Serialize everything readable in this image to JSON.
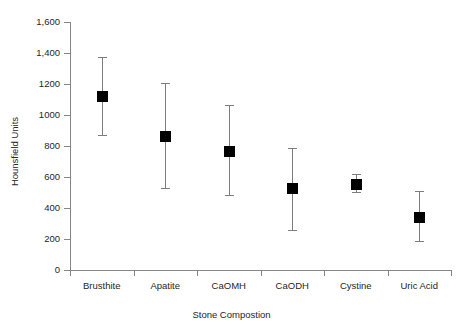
{
  "chart_data": {
    "type": "scatter",
    "title": "",
    "xlabel": "Stone Compostion",
    "ylabel": "Hounsfield Units",
    "categories": [
      "Brusthite",
      "Apatite",
      "CaOMH",
      "CaODH",
      "Cystine",
      "Uric Acid"
    ],
    "values": [
      1125,
      865,
      770,
      528,
      558,
      345
    ],
    "error_low": [
      870,
      530,
      485,
      260,
      505,
      185
    ],
    "error_high": [
      1375,
      1205,
      1065,
      785,
      620,
      510
    ],
    "ylim": [
      0,
      1600
    ],
    "ytick_labels": [
      "1,600",
      "1,400",
      "1200",
      "1000",
      "800",
      "600",
      "400",
      "200",
      "0"
    ],
    "ytick_values": [
      1600,
      1400,
      1200,
      1000,
      800,
      600,
      400,
      200,
      0
    ],
    "grid": false,
    "legend": "none",
    "marker": "filled-square",
    "marker_color": "#000000",
    "error_bar_color": "#7d7d7d",
    "axis_color": "#868686",
    "background": "#ffffff"
  }
}
